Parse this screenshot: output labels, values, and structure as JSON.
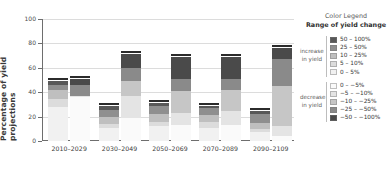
{
  "chart_data": {
    "type": "bar",
    "title": "",
    "xlabel": "",
    "ylabel": "Percentage of yield projections",
    "ylim": [
      0,
      100
    ],
    "yticks": [
      0,
      20,
      40,
      60,
      80,
      100
    ],
    "grid": true,
    "legend_position": "right",
    "stacked": true,
    "grouped": true,
    "categories": [
      "2010–2029",
      "2030–2049",
      "2050–2069",
      "2070–2089",
      "2090–2109"
    ],
    "bar_kinds": [
      "increase in yield",
      "decrease in yield"
    ],
    "series": [
      {
        "name": "0 – 5%",
        "group": "increase",
        "color": "#f1f1f1",
        "values": [
          27.5,
          10.5,
          12.0,
          11.0,
          7.0
        ]
      },
      {
        "name": "5 – 10%",
        "group": "increase",
        "color": "#dcdcdc",
        "values": [
          7.0,
          3.5,
          4.0,
          4.5,
          3.0
        ]
      },
      {
        "name": "10 – 25%",
        "group": "increase",
        "color": "#bfbfbf",
        "values": [
          7.5,
          5.5,
          6.0,
          5.5,
          5.0
        ]
      },
      {
        "name": "25 – 50%",
        "group": "increase",
        "color": "#8f8f8f",
        "values": [
          4.0,
          6.0,
          7.0,
          6.0,
          7.0
        ]
      },
      {
        "name": "50 – 100%",
        "group": "increase",
        "color": "#585858",
        "values": [
          3.0,
          3.5,
          2.0,
          2.0,
          3.0
        ]
      },
      {
        "name": "0 – −5%",
        "group": "decrease",
        "color": "#fafafa",
        "values": [
          36.0,
          19.0,
          13.0,
          13.0,
          4.0
        ]
      },
      {
        "name": "−5 – −10%",
        "group": "decrease",
        "color": "#e4e4e4",
        "values": [
          0.5,
          18.0,
          10.0,
          12.0,
          8.0
        ]
      },
      {
        "name": "−10 – −25%",
        "group": "decrease",
        "color": "#c6c6c6",
        "values": [
          0.5,
          12.5,
          18.0,
          17.0,
          33.0
        ]
      },
      {
        "name": "−25 – −50%",
        "group": "decrease",
        "color": "#8a8a8a",
        "values": [
          9.0,
          10.5,
          10.0,
          9.0,
          22.0
        ]
      },
      {
        "name": "−50 – −100%",
        "group": "decrease",
        "color": "#4a4a4a",
        "values": [
          5.0,
          11.5,
          18.0,
          18.0,
          9.0
        ]
      }
    ],
    "bar_totals": {
      "increase": [
        49.0,
        29.0,
        31.0,
        29.0,
        25.0
      ],
      "decrease": [
        51.0,
        71.5,
        69.0,
        69.0,
        76.0
      ]
    }
  },
  "legend": {
    "title_line1": "Color Legend",
    "title_line2": "Range of yield change",
    "increase_side_label": "increase\nin yield",
    "decrease_side_label": "decrease\nin yield",
    "increase_items": [
      {
        "label": "50 – 100%",
        "color": "#585858"
      },
      {
        "label": "25 – 50%",
        "color": "#8f8f8f"
      },
      {
        "label": "10 – 25%",
        "color": "#bfbfbf"
      },
      {
        "label": "5 – 10%",
        "color": "#dcdcdc"
      },
      {
        "label": "0 – 5%",
        "color": "#f1f1f1"
      }
    ],
    "decrease_items": [
      {
        "label": "0 – −5%",
        "color": "#fafafa"
      },
      {
        "label": "−5 – −10%",
        "color": "#e4e4e4"
      },
      {
        "label": "−10 – −25%",
        "color": "#c6c6c6"
      },
      {
        "label": "−25 – −50%",
        "color": "#8a8a8a"
      },
      {
        "label": "−50 – −100%",
        "color": "#4a4a4a"
      }
    ]
  },
  "colors": {
    "cap": "#2b2b2b",
    "axis": "#6e6e6e",
    "grid": "#dcdcdc",
    "text": "#3a3a3a"
  }
}
